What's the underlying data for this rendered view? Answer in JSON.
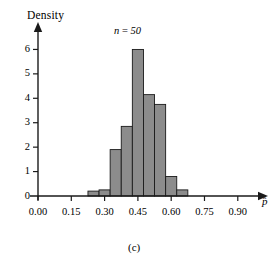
{
  "figure": {
    "caption": "(c)",
    "annotation": "n = 50",
    "annotation_symbol": "n",
    "annotation_value": "50",
    "annotation_equals": " = "
  },
  "chart_data": {
    "type": "bar",
    "title": "",
    "subtitle": "",
    "xlabel": "p̂",
    "ylabel": "Density",
    "annotations": [
      "n = 50",
      "(c)"
    ],
    "grid": false,
    "legend": null,
    "xlim": [
      0.0,
      0.955
    ],
    "ylim": [
      0,
      6.55
    ],
    "xticks": [
      0.0,
      0.15,
      0.3,
      0.45,
      0.6,
      0.75,
      0.9
    ],
    "xticklabels": [
      "0.00",
      "0.15",
      "0.30",
      "0.45",
      "0.60",
      "0.75",
      "0.90"
    ],
    "yticks": [
      0,
      1,
      2,
      3,
      4,
      5,
      6
    ],
    "yticklabels": [
      "0",
      "1",
      "2",
      "3",
      "4",
      "5",
      "6"
    ],
    "bin_width": 0.05,
    "bin_edges": [
      0.225,
      0.275,
      0.325,
      0.375,
      0.425,
      0.475,
      0.525,
      0.575,
      0.625,
      0.675
    ],
    "categories": [
      "0.225",
      "0.275",
      "0.325",
      "0.375",
      "0.425",
      "0.475",
      "0.525",
      "0.575",
      "0.625"
    ],
    "values": [
      0.2,
      0.25,
      1.9,
      2.85,
      6.0,
      4.15,
      3.75,
      0.8,
      0.25
    ],
    "bar_color": "#8c8c8c",
    "bar_edge_color": "#1a1a1a",
    "axis_color": "#1a1a1a"
  },
  "axes": {
    "y_title": "Density",
    "x_title": "p̂"
  },
  "colors": {
    "background": "#ffffff",
    "bar_fill": "#8c8c8c",
    "bar_edge": "#1a1a1a",
    "axis": "#1a1a1a",
    "text": "#000000"
  }
}
